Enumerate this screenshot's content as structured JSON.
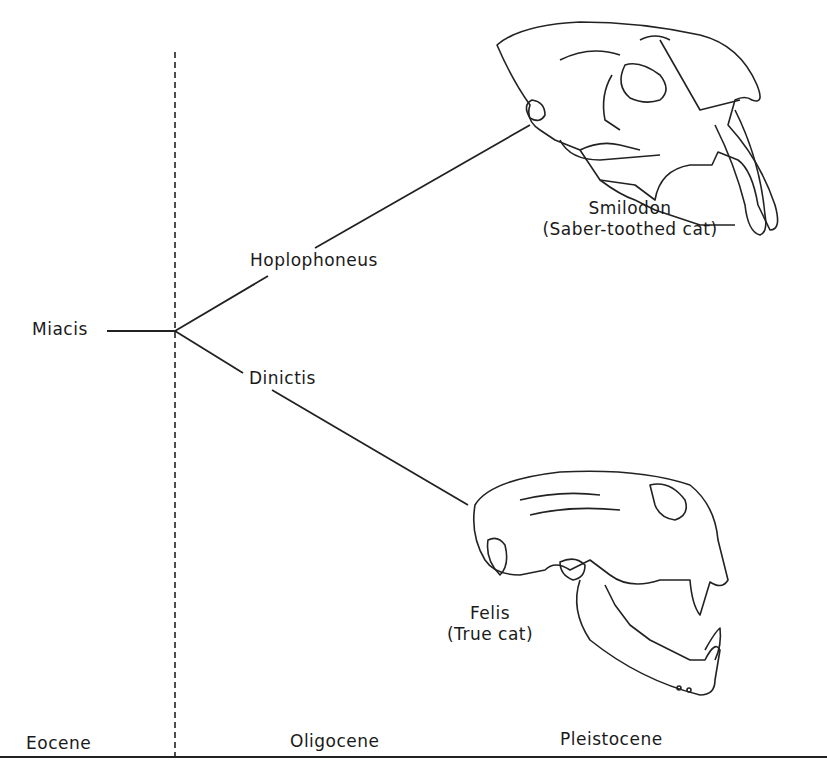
{
  "tree": {
    "root": {
      "label": "Miacis"
    },
    "branches": [
      {
        "label": "Hoplophoneus",
        "descendant": {
          "label": "Smilodon",
          "sublabel": "(Saber-toothed cat)",
          "illustration": "saber-toothed-cat-skull"
        }
      },
      {
        "label": "Dinictis",
        "descendant": {
          "label": "Felis",
          "sublabel": "(True cat)",
          "illustration": "true-cat-skull"
        }
      }
    ]
  },
  "timeline": {
    "epochs": [
      "Eocene",
      "Oligocene",
      "Pleistocene"
    ]
  }
}
